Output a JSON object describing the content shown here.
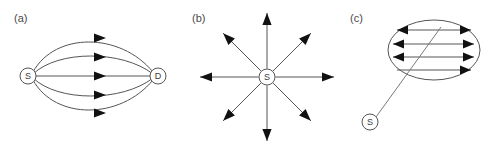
{
  "figure": {
    "background_color": "#ffffff",
    "stroke_color": "#555555",
    "arrow_color": "#111111",
    "label_color": "#4a4a4a",
    "width": 494,
    "height": 153
  },
  "panels": [
    {
      "id": "a",
      "label": "(a)",
      "label_x": 14,
      "label_y": 22,
      "description": "multipath flooding from source to destination",
      "nodes": [
        {
          "id": "source",
          "letter": "S",
          "cx": 28,
          "cy": 76,
          "r": 8
        },
        {
          "id": "destination",
          "letter": "D",
          "cx": 158,
          "cy": 76,
          "r": 8
        }
      ],
      "paths": [
        {
          "id": "path-1",
          "d": "M 33 72 C 55 32 120 32 153 72",
          "arrow_x": 95,
          "arrow_y": 38,
          "arrow_angle": 0
        },
        {
          "id": "path-2",
          "d": "M 33 74 C 58 50 122 50 153 74",
          "arrow_x": 95,
          "arrow_y": 57,
          "arrow_angle": 0
        },
        {
          "id": "path-3",
          "d": "M 36 76 L 150 76",
          "arrow_x": 95,
          "arrow_y": 76,
          "arrow_angle": 0
        },
        {
          "id": "path-4",
          "d": "M 33 78 C 58 102 122 102 153 78",
          "arrow_x": 95,
          "arrow_y": 95,
          "arrow_angle": 0
        },
        {
          "id": "path-5",
          "d": "M 33 80 C 55 120 120 120 153 80",
          "arrow_x": 95,
          "arrow_y": 113,
          "arrow_angle": 0
        }
      ]
    },
    {
      "id": "b",
      "label": "(b)",
      "label_x": 192,
      "label_y": 22,
      "description": "omnidirectional broadcast from source in eight directions",
      "nodes": [
        {
          "id": "source",
          "letter": "S",
          "cx": 267,
          "cy": 77,
          "r": 8
        }
      ],
      "rays": [
        {
          "id": "ray-n",
          "angle": -90,
          "length": 64
        },
        {
          "id": "ray-ne",
          "angle": -45,
          "length": 62
        },
        {
          "id": "ray-e",
          "angle": 0,
          "length": 67
        },
        {
          "id": "ray-se",
          "angle": 45,
          "length": 62
        },
        {
          "id": "ray-s",
          "angle": 90,
          "length": 64
        },
        {
          "id": "ray-sw",
          "angle": 135,
          "length": 62
        },
        {
          "id": "ray-w",
          "angle": 180,
          "length": 67
        },
        {
          "id": "ray-nw",
          "angle": -135,
          "length": 62
        }
      ]
    },
    {
      "id": "c",
      "label": "(c)",
      "label_x": 350,
      "label_y": 22,
      "description": "source links to a region where bidirectional flows are exchanged",
      "nodes": [
        {
          "id": "source",
          "letter": "S",
          "cx": 370,
          "cy": 122,
          "r": 8
        }
      ],
      "region": {
        "id": "zone-ellipse",
        "cx": 434,
        "cy": 50,
        "rx": 46,
        "ry": 30
      },
      "link": {
        "id": "source-to-zone",
        "x1": 376,
        "y1": 117,
        "x2": 441,
        "y2": 27
      },
      "flows": [
        {
          "id": "flow-1",
          "x1": 397,
          "x2": 471,
          "y": 30,
          "left_arrow": true,
          "right_arrow": true
        },
        {
          "id": "flow-2",
          "x1": 393,
          "x2": 474,
          "y": 44,
          "left_arrow": true,
          "right_arrow": true
        },
        {
          "id": "flow-3",
          "x1": 393,
          "x2": 474,
          "y": 57,
          "left_arrow": true,
          "right_arrow": true
        },
        {
          "id": "flow-4",
          "x1": 397,
          "x2": 471,
          "y": 70,
          "left_arrow": false,
          "right_arrow": true
        }
      ]
    }
  ]
}
